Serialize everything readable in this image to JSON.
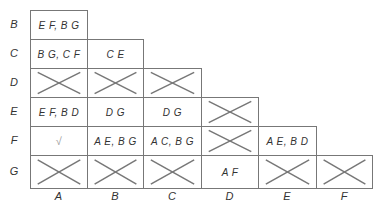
{
  "diagram": {
    "type": "implication-table",
    "row_labels": [
      "B",
      "C",
      "D",
      "E",
      "F",
      "G"
    ],
    "col_labels": [
      "A",
      "B",
      "C",
      "D",
      "E",
      "F"
    ],
    "cells": {
      "B": {
        "A": "E F, B G"
      },
      "C": {
        "A": "B G, C F",
        "B": "C E"
      },
      "D": {
        "A": "X",
        "B": "X",
        "C": "X"
      },
      "E": {
        "A": "E F, B D",
        "B": "D G",
        "C": "D G",
        "D": "X"
      },
      "F": {
        "A": "√",
        "B": "A E, B G",
        "C": "A C, B G",
        "D": "X",
        "E": "A E, B D"
      },
      "G": {
        "A": "X",
        "B": "X",
        "C": "X",
        "D": "A F",
        "E": "X",
        "F": "X"
      }
    },
    "colors": {
      "line": "#777777",
      "text": "#333333",
      "check": "#999999"
    }
  }
}
